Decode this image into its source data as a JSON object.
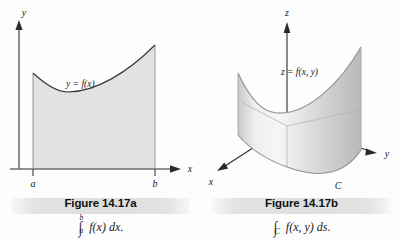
{
  "figure_a": {
    "axes": {
      "y_label": "y",
      "x_label": "x",
      "tick_left_label": "a",
      "tick_right_label": "b"
    },
    "curve_label": "y = f(x)",
    "caption": {
      "title": "Figure 14.17a",
      "formula_plain": "∫ₐᵇ f(x) dx.",
      "integral_symbol": "∫",
      "lower_limit": "a",
      "upper_limit": "b",
      "integrand": "f(x)",
      "differential": "dx",
      "terminator": "."
    },
    "region_fill": "#e2e2e2",
    "curve_color": "#3a3a3a"
  },
  "figure_b": {
    "axes": {
      "z_label": "z",
      "x_label": "x",
      "y_label": "y"
    },
    "surface_label": "z = f(x, y)",
    "curve_label": "C",
    "caption": {
      "title": "Figure 14.17b",
      "formula_plain": "∫_C f(x, y) ds.",
      "integral_symbol": "∫",
      "path_subscript": "C",
      "integrand": "f(x, y)",
      "differential": "ds",
      "terminator": "."
    },
    "surface_fill_light": "#f2f2f2",
    "surface_fill_dark": "#b9b9b9",
    "axis_color": "#2b2b2b"
  },
  "caption_band_color": "#e0e0e0",
  "page_background": "#fdfdfd"
}
